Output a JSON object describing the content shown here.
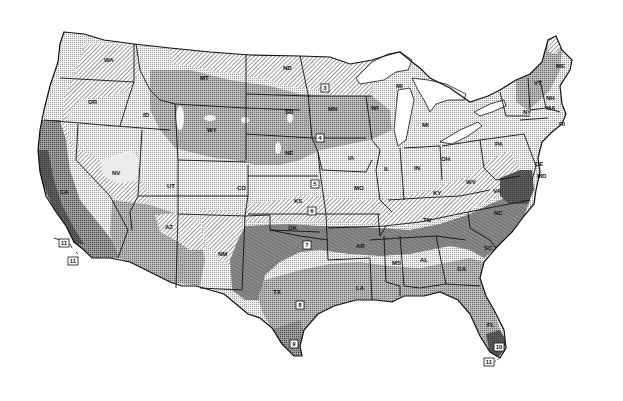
{
  "map": {
    "title": "USDA Plant Hardiness Zone Map (continental United States)",
    "palette": {
      "zone_3": "#e8e8e8",
      "zone_4": "#9a9a9a",
      "zone_5": "#dcdcdc",
      "zone_6": "#e4e4e4",
      "zone_7": "#cfcfcf",
      "zone_8": "#7e7e7e",
      "zone_9": "#a6a6a6",
      "zone_10": "#5a5a5a",
      "zone_11": "#ffffff",
      "water": "#ffffff",
      "line": "#111111"
    },
    "state_labels": [
      {
        "id": "WA",
        "text": "WA",
        "x": 104,
        "y": 62
      },
      {
        "id": "OR",
        "text": "OR",
        "x": 88,
        "y": 104
      },
      {
        "id": "ID",
        "text": "ID",
        "x": 143,
        "y": 117
      },
      {
        "id": "MT",
        "text": "MT",
        "x": 200,
        "y": 80
      },
      {
        "id": "WY",
        "text": "WY",
        "x": 207,
        "y": 132
      },
      {
        "id": "ND",
        "text": "ND",
        "x": 283,
        "y": 70
      },
      {
        "id": "SD",
        "text": "SD",
        "x": 285,
        "y": 114
      },
      {
        "id": "NE",
        "text": "NE",
        "x": 285,
        "y": 155
      },
      {
        "id": "MN",
        "text": "MN",
        "x": 328,
        "y": 111
      },
      {
        "id": "WI",
        "text": "WI",
        "x": 371,
        "y": 110
      },
      {
        "id": "MI_UP",
        "text": "MI",
        "x": 396,
        "y": 88
      },
      {
        "id": "MI",
        "text": "MI",
        "x": 422,
        "y": 127
      },
      {
        "id": "IA",
        "text": "IA",
        "x": 348,
        "y": 160
      },
      {
        "id": "IL",
        "text": "IL",
        "x": 384,
        "y": 171
      },
      {
        "id": "IN",
        "text": "IN",
        "x": 414,
        "y": 170
      },
      {
        "id": "OH",
        "text": "OH",
        "x": 441,
        "y": 161
      },
      {
        "id": "PA",
        "text": "PA",
        "x": 495,
        "y": 146
      },
      {
        "id": "NY",
        "text": "NY",
        "x": 523,
        "y": 114
      },
      {
        "id": "VT",
        "text": "VT",
        "x": 534,
        "y": 85
      },
      {
        "id": "NH",
        "text": "NH",
        "x": 546,
        "y": 100
      },
      {
        "id": "ME",
        "text": "ME",
        "x": 556,
        "y": 68
      },
      {
        "id": "MA",
        "text": "MA",
        "x": 546,
        "y": 110
      },
      {
        "id": "RI",
        "text": "RI",
        "x": 559,
        "y": 126
      },
      {
        "id": "DE",
        "text": "DE",
        "x": 535,
        "y": 166
      },
      {
        "id": "MD",
        "text": "MD",
        "x": 537,
        "y": 178
      },
      {
        "id": "WV",
        "text": "WV",
        "x": 466,
        "y": 184
      },
      {
        "id": "VA",
        "text": "VA",
        "x": 493,
        "y": 193
      },
      {
        "id": "KY",
        "text": "KY",
        "x": 433,
        "y": 195
      },
      {
        "id": "TN",
        "text": "TN",
        "x": 423,
        "y": 222
      },
      {
        "id": "NC",
        "text": "NC",
        "x": 494,
        "y": 215
      },
      {
        "id": "SC",
        "text": "SC",
        "x": 484,
        "y": 250
      },
      {
        "id": "GA",
        "text": "GA",
        "x": 457,
        "y": 271
      },
      {
        "id": "AL",
        "text": "AL",
        "x": 420,
        "y": 262
      },
      {
        "id": "MS",
        "text": "MS",
        "x": 392,
        "y": 265
      },
      {
        "id": "LA",
        "text": "LA",
        "x": 356,
        "y": 290
      },
      {
        "id": "AR",
        "text": "AR",
        "x": 356,
        "y": 248
      },
      {
        "id": "MO",
        "text": "MO",
        "x": 354,
        "y": 190
      },
      {
        "id": "KS",
        "text": "KS",
        "x": 294,
        "y": 203
      },
      {
        "id": "OK",
        "text": "OK",
        "x": 288,
        "y": 230
      },
      {
        "id": "TX",
        "text": "TX",
        "x": 273,
        "y": 294
      },
      {
        "id": "NM",
        "text": "NM",
        "x": 218,
        "y": 256
      },
      {
        "id": "CO",
        "text": "CO",
        "x": 237,
        "y": 190
      },
      {
        "id": "UT",
        "text": "UT",
        "x": 167,
        "y": 188
      },
      {
        "id": "AZ",
        "text": "AZ",
        "x": 165,
        "y": 229
      },
      {
        "id": "NV",
        "text": "NV",
        "x": 112,
        "y": 175
      },
      {
        "id": "CA",
        "text": "CA",
        "x": 60,
        "y": 194
      },
      {
        "id": "FL",
        "text": "FL",
        "x": 487,
        "y": 327
      }
    ],
    "zone_markers": [
      {
        "zone": "3",
        "x": 325,
        "y": 88
      },
      {
        "zone": "4",
        "x": 320,
        "y": 138
      },
      {
        "zone": "5",
        "x": 315,
        "y": 184
      },
      {
        "zone": "6",
        "x": 312,
        "y": 211
      },
      {
        "zone": "7",
        "x": 307,
        "y": 245
      },
      {
        "zone": "8",
        "x": 300,
        "y": 305
      },
      {
        "zone": "9",
        "x": 294,
        "y": 344
      },
      {
        "zone": "10",
        "x": 499,
        "y": 347
      },
      {
        "zone": "11",
        "x": 489,
        "y": 362
      },
      {
        "zone": "11",
        "x": 64,
        "y": 243
      },
      {
        "zone": "11",
        "x": 73,
        "y": 261
      }
    ]
  }
}
